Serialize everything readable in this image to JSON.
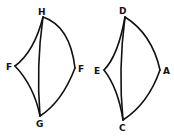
{
  "figures": [
    {
      "name": "left-figure",
      "labels": {
        "top": "H",
        "left": "F",
        "right": "F",
        "bottom": "G"
      }
    },
    {
      "name": "right-figure",
      "labels": {
        "top": "D",
        "left": "E",
        "right": "A",
        "bottom": "C"
      }
    }
  ],
  "colors": {
    "stroke": "#111111",
    "background": "#ffffff"
  }
}
